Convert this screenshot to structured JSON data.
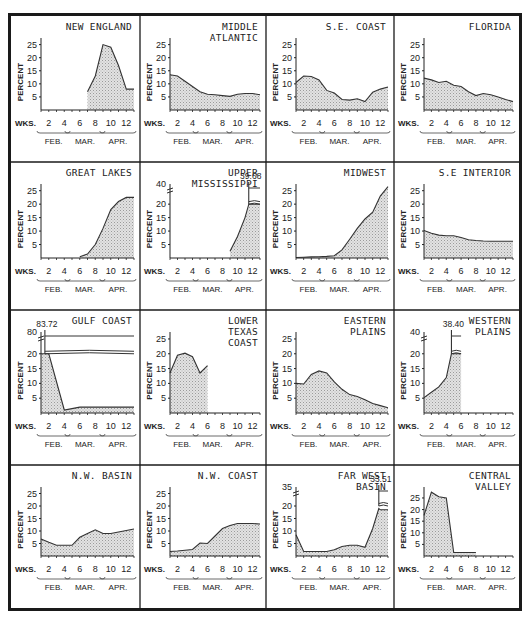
{
  "chart_data": {
    "type": "area",
    "grid": false,
    "common": {
      "xlabel": "WKS.",
      "ylabel": "PERCENT",
      "x_ticks": [
        2,
        4,
        6,
        8,
        10,
        12
      ],
      "months": [
        "FEB.",
        "MAR.",
        "APR."
      ],
      "x_range": [
        1,
        13
      ]
    },
    "panels": [
      {
        "title": [
          "NEW ENGLAND"
        ],
        "y_ticks": [
          5,
          10,
          15,
          20,
          25
        ],
        "ylim": [
          0,
          26
        ],
        "x": [
          7,
          8,
          9,
          10,
          11,
          12,
          13
        ],
        "y": [
          7,
          13,
          25,
          24,
          17,
          8,
          8
        ]
      },
      {
        "title": [
          "MIDDLE",
          "ATLANTIC"
        ],
        "y_ticks": [
          5,
          10,
          15,
          20,
          25
        ],
        "ylim": [
          0,
          26
        ],
        "x": [
          1,
          2,
          3,
          4,
          5,
          6,
          7,
          8,
          9,
          10,
          11,
          12,
          13
        ],
        "y": [
          13.5,
          13,
          11,
          9,
          7,
          6,
          5.8,
          5.5,
          5.2,
          6,
          6.3,
          6.3,
          5.8
        ]
      },
      {
        "title": [
          "S.E. COAST"
        ],
        "y_ticks": [
          5,
          10,
          15,
          20,
          25
        ],
        "ylim": [
          0,
          26
        ],
        "x": [
          1,
          2,
          3,
          4,
          5,
          6,
          7,
          8,
          9,
          10,
          11,
          12,
          13
        ],
        "y": [
          10.5,
          13,
          12.8,
          11.5,
          7.5,
          6.5,
          4,
          3.8,
          4.3,
          3.2,
          6.8,
          8,
          8.8
        ]
      },
      {
        "title": [
          "FLORIDA"
        ],
        "y_ticks": [
          5,
          10,
          15,
          20,
          25
        ],
        "ylim": [
          0,
          26
        ],
        "x": [
          1,
          2,
          3,
          4,
          5,
          6,
          7,
          8,
          9,
          10,
          11,
          12,
          13
        ],
        "y": [
          12.2,
          11.5,
          10.5,
          11,
          9.5,
          9,
          7,
          5.5,
          6.3,
          5.8,
          5,
          4,
          3.2
        ]
      },
      {
        "title": [
          "GREAT LAKES"
        ],
        "y_ticks": [
          5,
          10,
          15,
          20,
          25
        ],
        "ylim": [
          0,
          26
        ],
        "x": [
          6,
          7,
          8,
          9,
          10,
          11,
          12,
          13
        ],
        "y": [
          0.5,
          1.5,
          5,
          11,
          18,
          21,
          22.5,
          22.5
        ]
      },
      {
        "title": [
          "UPPER",
          "MISSISSIPPI"
        ],
        "y_ticks": [
          5,
          10,
          15,
          20
        ],
        "y_top_label": 40,
        "ylim": [
          0,
          26
        ],
        "broken_axis": true,
        "annotation": "39.68",
        "peak_week": 11.5,
        "x": [
          9,
          10,
          11,
          11.5,
          12,
          13
        ],
        "y": [
          2.5,
          8,
          15,
          20,
          20,
          20
        ]
      },
      {
        "title": [
          "MIDWEST"
        ],
        "y_ticks": [
          5,
          10,
          15,
          20,
          25
        ],
        "ylim": [
          0,
          26
        ],
        "x": [
          1,
          2,
          3,
          4,
          5,
          6,
          7,
          8,
          9,
          10,
          11,
          12,
          13
        ],
        "y": [
          0.2,
          0.3,
          0.4,
          0.5,
          0.6,
          0.8,
          3,
          7,
          11,
          14.5,
          17,
          23,
          26.5
        ]
      },
      {
        "title": [
          "S.E INTERIOR"
        ],
        "y_ticks": [
          5,
          10,
          15,
          20,
          25
        ],
        "ylim": [
          0,
          26
        ],
        "x": [
          1,
          2,
          3,
          4,
          5,
          6,
          7,
          8,
          9,
          10,
          11,
          12,
          13
        ],
        "y": [
          10.2,
          9.2,
          8.5,
          8.3,
          8.3,
          7.6,
          6.8,
          6.5,
          6.3,
          6.2,
          6.2,
          6.2,
          6.2
        ]
      },
      {
        "title": [
          "GULF COAST"
        ],
        "y_ticks": [
          5,
          10,
          15,
          20
        ],
        "y_top_label": 80,
        "ylim": [
          0,
          26
        ],
        "broken_axis": true,
        "annotation": "83.72",
        "peak_week": 1.5,
        "x": [
          1,
          2,
          4,
          5,
          6,
          7,
          8,
          9,
          10,
          11,
          12,
          13
        ],
        "y": [
          20,
          20,
          1,
          1.5,
          2,
          2,
          2,
          2,
          2,
          2,
          2,
          2
        ]
      },
      {
        "title": [
          "LOWER",
          "TEXAS",
          "COAST"
        ],
        "y_ticks": [
          5,
          10,
          15,
          20,
          25
        ],
        "ylim": [
          0,
          26
        ],
        "x": [
          1,
          2,
          3,
          4,
          5,
          6
        ],
        "y": [
          13.5,
          19.5,
          20.2,
          19,
          13.5,
          16
        ]
      },
      {
        "title": [
          "EASTERN",
          "PLAINS"
        ],
        "y_ticks": [
          5,
          10,
          15,
          20,
          25
        ],
        "ylim": [
          0,
          26
        ],
        "x": [
          1,
          2,
          3,
          4,
          5,
          6,
          7,
          8,
          9,
          10,
          11,
          12,
          13
        ],
        "y": [
          10,
          9.8,
          13,
          14.2,
          13.5,
          10.5,
          8,
          6.2,
          5.6,
          4.5,
          3.2,
          2.5,
          1.8
        ]
      },
      {
        "title": [
          "WESTERN",
          "PLAINS"
        ],
        "y_ticks": [
          5,
          10,
          15,
          20
        ],
        "y_top_label": 40,
        "ylim": [
          0,
          26
        ],
        "broken_axis": true,
        "annotation": "38.40",
        "peak_week": 4.7,
        "x": [
          1,
          2,
          3,
          4,
          4.7,
          5,
          6
        ],
        "y": [
          5.2,
          7,
          8.8,
          12,
          20,
          20,
          20
        ]
      },
      {
        "title": [
          "N.W. BASIN"
        ],
        "y_ticks": [
          5,
          10,
          15,
          20,
          25
        ],
        "ylim": [
          0,
          26
        ],
        "x": [
          1,
          2,
          3,
          4,
          5,
          6,
          7,
          8,
          9,
          10,
          11,
          12,
          13
        ],
        "y": [
          6.8,
          5.5,
          4.3,
          4.3,
          4.3,
          7.5,
          9,
          10.5,
          9,
          9,
          9.6,
          10.2,
          10.8
        ]
      },
      {
        "title": [
          "N.W. COAST"
        ],
        "y_ticks": [
          5,
          10,
          15,
          20,
          25
        ],
        "ylim": [
          0,
          26
        ],
        "x": [
          1,
          2,
          3,
          4,
          5,
          6,
          7,
          8,
          9,
          10,
          11,
          12,
          13
        ],
        "y": [
          1.8,
          2,
          2.3,
          2.6,
          5.2,
          5,
          8,
          11,
          12.2,
          13,
          13,
          13,
          12.8
        ]
      },
      {
        "title": [
          "FAR WEST",
          "BASIN"
        ],
        "y_ticks": [
          5,
          10,
          15,
          20
        ],
        "y_top_label": 35,
        "ylim": [
          0,
          26
        ],
        "broken_axis": true,
        "annotation": "33.51",
        "peak_week": 11.8,
        "x": [
          1,
          2,
          3,
          4,
          5,
          6,
          7,
          8,
          9,
          10,
          11,
          11.8,
          12,
          13
        ],
        "y": [
          8.5,
          1.8,
          1.8,
          1.8,
          1.8,
          2.5,
          3.8,
          4.3,
          4.3,
          3.5,
          11,
          19,
          18.5,
          18.5
        ]
      },
      {
        "title": [
          "CENTRAL",
          "VALLEY"
        ],
        "y_ticks": [
          5,
          10,
          15,
          20,
          25
        ],
        "ylim": [
          0,
          28
        ],
        "x": [
          1,
          2,
          3,
          4,
          5,
          6,
          7,
          8
        ],
        "y": [
          17.5,
          27.5,
          25.5,
          25,
          1.5,
          1.5,
          1.5,
          1.5
        ]
      }
    ]
  }
}
